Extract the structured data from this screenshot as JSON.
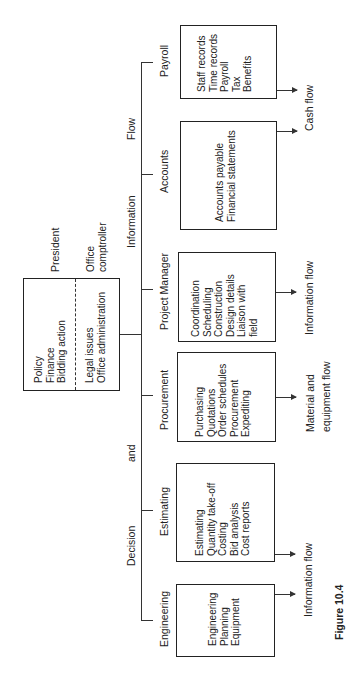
{
  "figure_caption": "Figure 10.4",
  "header": {
    "words": [
      "Decision",
      "and",
      "Information",
      "Flow"
    ]
  },
  "president": {
    "title": "President",
    "left_items": "Policy\nFinance\nBidding action",
    "right_title": "Office\ncomptroller",
    "right_items": "Legal issues\nOffice administration"
  },
  "departments": [
    {
      "name": "Engineering",
      "items": "Engineering\nPlanning\nEquipment",
      "output": "Information flow"
    },
    {
      "name": "Estimating",
      "items": "Estimating\nQuantity take-off\nCosting\nBid analysis\nCost reports",
      "output": ""
    },
    {
      "name": "Procurement",
      "items": "Purchasing\nQuotations\nOrder schedules\nProcurement\nExpediting",
      "output": "Material and\nequipment flow"
    },
    {
      "name": "Project Manager",
      "items": "Coordination\nScheduling\nConstruction\nDesign details\nLiaison with\nfield",
      "output": "Information flow"
    },
    {
      "name": "Accounts",
      "items": "Accounts payable\nFinancial statements",
      "output": "Cash flow"
    },
    {
      "name": "Payroll",
      "items": "Staff records\nTime records\nPayroll\nTax\nBenefits",
      "output": ""
    }
  ]
}
